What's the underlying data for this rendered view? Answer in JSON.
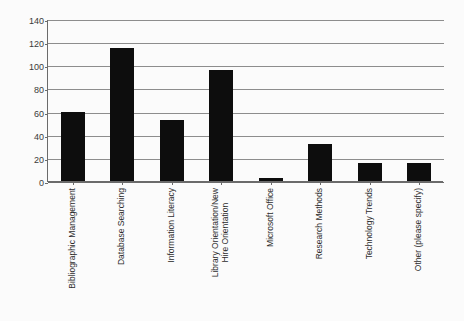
{
  "chart_data": {
    "type": "bar",
    "title": "",
    "subtitle": "",
    "xlabel": "",
    "ylabel": "",
    "ylim": [
      0,
      140
    ],
    "ytick_step": 20,
    "grid": "horizontal",
    "legend": "none",
    "bar_color": "#0d0d0d",
    "background_color": "#fbfbfb",
    "axis_color": "#6b6b6b",
    "gridline_color": "#8d8d8d",
    "yticks": [
      "140",
      "120",
      "100",
      "80",
      "60",
      "40",
      "20",
      "0"
    ],
    "ytick_values": [
      140,
      120,
      100,
      80,
      60,
      40,
      20,
      0
    ],
    "categories": [
      "Bibliographic Management",
      "Database Searching",
      "Information Literacy",
      "Library Orientation/New Hire Orientation",
      "Microsoft Office",
      "Research Methods",
      "Technology Trends",
      "Other (please specify)"
    ],
    "category_lines": [
      [
        "Bibliographic Management"
      ],
      [
        "Database Searching"
      ],
      [
        "Information Literacy"
      ],
      [
        "Library Orientation/New",
        "Hire Orientation"
      ],
      [
        "Microsoft Office"
      ],
      [
        "Research Methods"
      ],
      [
        "Technology Trends"
      ],
      [
        "Other (please specify)"
      ]
    ],
    "values": [
      60,
      115,
      53,
      96,
      3,
      32,
      16,
      16
    ]
  }
}
